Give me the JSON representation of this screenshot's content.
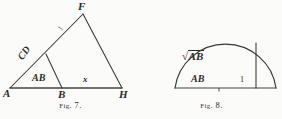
{
  "page": {
    "background_color": "#fbfbfa",
    "ink_color": "#2c2926",
    "width": 282,
    "height": 119
  },
  "figure7": {
    "caption_small_caps": "Fig",
    "caption_rest": ". 7.",
    "caption_full": "FIG. 7.",
    "type": "triangle-construction",
    "vertices": [
      {
        "name": "A",
        "label": "A",
        "x": 10,
        "y": 88
      },
      {
        "name": "B",
        "label": "B",
        "x": 62,
        "y": 88
      },
      {
        "name": "H",
        "label": "H",
        "x": 122,
        "y": 88
      },
      {
        "name": "F",
        "label": "F",
        "x": 83,
        "y": 14
      },
      {
        "name": "D",
        "label": "",
        "x": 46,
        "y": 54
      }
    ],
    "segments": [
      {
        "from": "A",
        "to": "H",
        "role": "baseline"
      },
      {
        "from": "A",
        "to": "F",
        "role": "long-side"
      },
      {
        "from": "F",
        "to": "H",
        "role": "right-side"
      },
      {
        "from": "D",
        "to": "B",
        "role": "inner-segment"
      }
    ],
    "labels": {
      "vertex_a": "A",
      "vertex_b": "B",
      "vertex_h": "H",
      "vertex_f": "F",
      "segment_ab": "AB",
      "segment_bh": "x",
      "segment_ad": "CD",
      "segment_df": "1"
    }
  },
  "figure8": {
    "caption_small_caps": "Fig",
    "caption_rest": ". 8.",
    "caption_full": "FIG. 8.",
    "type": "semicircle-construction",
    "geometry": {
      "diameter_left_x": 34,
      "diameter_right_x": 135,
      "baseline_y": 88,
      "center_x": 84,
      "radius": 51,
      "vertical_line_x": 115,
      "vertical_top_y": 43
    },
    "labels": {
      "segment_ab": "AB",
      "segment_unit": "1",
      "altitude_radical_sign": "√",
      "altitude_radicand": "AB",
      "altitude_full": "√AB"
    }
  }
}
